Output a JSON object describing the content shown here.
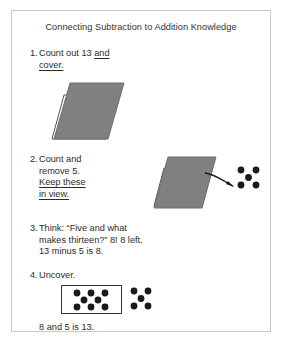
{
  "figure": {
    "title": "Connecting Subtraction to Addition Knowledge",
    "border_color": "#c9c9c9",
    "background": "#ffffff"
  },
  "colors": {
    "counter_gray": "#808080",
    "counter_outline": "#555555",
    "dot_color": "#1a1a1a",
    "text": "#2b2b2b",
    "box_outline": "#333333"
  },
  "steps": [
    {
      "number": "1.",
      "lines": [
        "Count out 13 and",
        "cover."
      ],
      "underlined": [
        "and",
        "cover."
      ],
      "illustration": {
        "name": "covered-counters",
        "description": "white outlined parallelogram covered by gray parallelogram",
        "fill": "#808080"
      }
    },
    {
      "number": "2.",
      "lines": [
        "Count and",
        "remove 5.",
        "Keep these",
        "in view."
      ],
      "underlined": [
        "Keep these",
        "in view."
      ],
      "illustration": {
        "name": "covered-counters-with-arrow",
        "description": "gray covered parallelogram with arrow pointing to five removed counters",
        "fill": "#808080",
        "removed_dots": 5,
        "dot_pattern": "dice-five"
      }
    },
    {
      "number": "3.",
      "lines": [
        "Think: “Five and what",
        "makes thirteen?” 8! 8 left.",
        "13 minus 5 is 8."
      ],
      "underlined": []
    },
    {
      "number": "4.",
      "lines": [
        "Uncover."
      ],
      "underlined": [],
      "illustration": {
        "name": "uncovered-counters",
        "boxed_dots": 8,
        "boxed_pattern": "3-2-3",
        "loose_dots": 5,
        "loose_pattern": "dice-five"
      }
    }
  ],
  "closing_text": "8 and 5 is 13.",
  "math": {
    "total": 13,
    "removed": 5,
    "remaining": 8,
    "subtraction_sentence": "13 minus 5 is 8.",
    "addition_sentence": "8 and 5 is 13."
  }
}
